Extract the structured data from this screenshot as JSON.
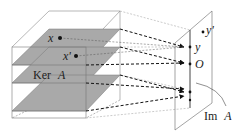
{
  "diagram": {
    "labels": {
      "x": "x",
      "x_prime": "x'",
      "y": "y",
      "y_prime": "y'",
      "origin": "O",
      "kernel": "Ker A",
      "kernel_name": "Ker",
      "kernel_letter": "A",
      "image": "Im A",
      "image_name": "Im",
      "image_letter": "A"
    },
    "colors": {
      "plane_fill": "#a9a9a9",
      "line": "#555555",
      "arrow": "#111111",
      "background": "#ffffff"
    },
    "layers": [
      {
        "name": "layer-top",
        "contains": [
          "x",
          "x'"
        ],
        "maps_to": "y"
      },
      {
        "name": "layer-kernel",
        "label": "Ker A",
        "maps_to": "O"
      },
      {
        "name": "layer-lower",
        "maps_to": "point-lower"
      },
      {
        "name": "layer-bottom",
        "maps_to": "point-bottom"
      }
    ]
  }
}
